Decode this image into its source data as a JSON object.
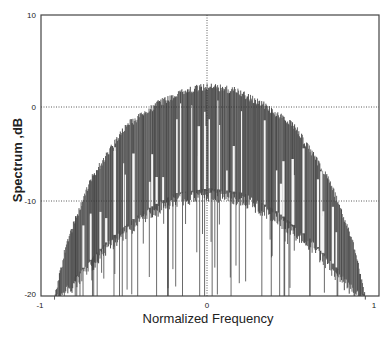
{
  "chart_data": {
    "type": "area",
    "title": "",
    "xlabel": "Normalized Frequency",
    "ylabel": "Spectrum ,dB",
    "xlim": [
      -1,
      1
    ],
    "ylim": [
      -20,
      10
    ],
    "x_ticks": [
      "-1",
      "0",
      "1"
    ],
    "y_ticks": [
      "10",
      "0",
      "-10",
      "-20"
    ],
    "grid": "dotted lines at x=0, y=0, y=-10",
    "legend": null,
    "series": [
      {
        "name": "Spectrum upper envelope",
        "x": [
          -0.92,
          -0.85,
          -0.7,
          -0.5,
          -0.3,
          -0.15,
          0,
          0.15,
          0.3,
          0.5,
          0.7,
          0.85,
          0.92
        ],
        "values": [
          -20,
          -14,
          -7,
          -1.5,
          1,
          2.3,
          2.8,
          2.3,
          1,
          -1.5,
          -7,
          -14,
          -20
        ]
      },
      {
        "name": "Spectrum lower envelope (approx, dense deep nulls)",
        "x": [
          -0.92,
          -0.8,
          -0.6,
          -0.4,
          -0.2,
          0,
          0.2,
          0.4,
          0.6,
          0.8,
          0.92
        ],
        "values": [
          -20,
          -18,
          -14,
          -11,
          -9,
          -8.5,
          -9,
          -11,
          -14,
          -18,
          -20
        ]
      }
    ]
  },
  "labels": {
    "ylabel": "Spectrum ,dB",
    "xlabel": "Normalized Frequency",
    "y10": "10",
    "y0": "0",
    "ym10": "-10",
    "ym20": "-20",
    "xm1": "-1",
    "x0": "0",
    "x1": "1"
  }
}
